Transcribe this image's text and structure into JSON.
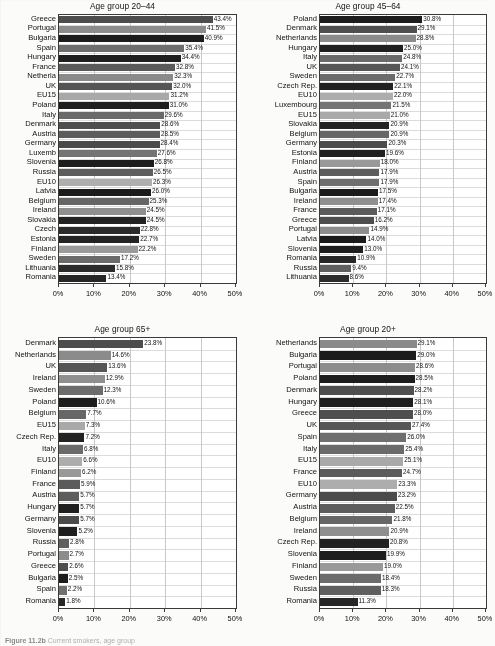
{
  "figure": {
    "caption_prefix": "Figure 11.2b",
    "caption_rest": "Current smokers, age group"
  },
  "axis": {
    "ticks": [
      "0%",
      "10%",
      "20%",
      "30%",
      "40%",
      "50%"
    ],
    "min": 0,
    "max": 50
  },
  "chart_data": [
    {
      "type": "bar",
      "orientation": "horizontal",
      "title": "Age group 20–44",
      "xlabel": "",
      "ylabel": "",
      "xlim": [
        0,
        50
      ],
      "grid": true,
      "legend": "none",
      "categories": [
        "Greece",
        "Portugal",
        "Bulgaria",
        "Spain",
        "Hungary",
        "France",
        "Netherla",
        "UK",
        "EU15",
        "Poland",
        "Italy",
        "Denmark",
        "Austria",
        "Germany",
        "Luxemb",
        "Slovenia",
        "Russia",
        "EU10",
        "Latvia",
        "Belgium",
        "Ireland",
        "Slovakia",
        "Czech",
        "Estonia",
        "Finland",
        "Sweden",
        "Lithuania",
        "Romania"
      ],
      "values": [
        43.4,
        41.5,
        40.9,
        35.4,
        34.4,
        32.8,
        32.3,
        32.0,
        31.2,
        31.0,
        29.6,
        28.6,
        28.5,
        28.4,
        27.6,
        26.8,
        26.5,
        26.3,
        26.0,
        25.3,
        24.5,
        24.5,
        22.8,
        22.7,
        22.2,
        17.2,
        15.8,
        13.4
      ],
      "labels": [
        "43.4%",
        "41.5%",
        "40.9%",
        "35.4%",
        "34.4%",
        "32.8%",
        "32.3%",
        "32.0%",
        "31.2%",
        "31.0%",
        "29.6%",
        "28.6%",
        "28.5%",
        "28.4%",
        "27.6%",
        "26.8%",
        "26.5%",
        "26.3%",
        "26.0%",
        "25.3%",
        "24.5%",
        "24.5%",
        "22.8%",
        "22.7%",
        "22.2%",
        "17.2%",
        "15.8%",
        "13.4%"
      ],
      "shades": [
        "#4d4d4d",
        "#8c8c8c",
        "#1c1c1c",
        "#6e6e6e",
        "#1f1f1f",
        "#5a5a5a",
        "#8a8a8a",
        "#555555",
        "#a8a8a8",
        "#1e1e1e",
        "#6a6a6a",
        "#4f4f4f",
        "#5c5c5c",
        "#4a4a4a",
        "#747474",
        "#1d1d1d",
        "#5e5e5e",
        "#aeaeae",
        "#1b1b1b",
        "#666666",
        "#8f8f8f",
        "#222222",
        "#2a2a2a",
        "#232323",
        "#9a9a9a",
        "#6b6b6b",
        "#2b2b2b",
        "#262626"
      ]
    },
    {
      "type": "bar",
      "orientation": "horizontal",
      "title": "Age group 45–64",
      "xlabel": "",
      "ylabel": "",
      "xlim": [
        0,
        50
      ],
      "grid": true,
      "legend": "none",
      "categories": [
        "Poland",
        "Denmark",
        "Netherlands",
        "Hungary",
        "Italy",
        "UK",
        "Sweden",
        "Czech Rep.",
        "EU10",
        "Luxembourg",
        "EU15",
        "Slovakia",
        "Belgium",
        "Germany",
        "Estonia",
        "Finland",
        "Austria",
        "Spain",
        "Bulgaria",
        "Ireland",
        "France",
        "Greece",
        "Portugal",
        "Latvia",
        "Slovenia",
        "Romania",
        "Russia",
        "Lithuania"
      ],
      "values": [
        30.8,
        29.1,
        28.8,
        25.0,
        24.8,
        24.1,
        22.7,
        22.1,
        22.0,
        21.5,
        21.0,
        20.9,
        20.9,
        20.3,
        19.6,
        18.0,
        17.9,
        17.9,
        17.5,
        17.4,
        17.1,
        16.2,
        14.9,
        14.0,
        13.0,
        10.9,
        9.4,
        8.6
      ],
      "labels": [
        "30.8%",
        "29.1%",
        "28.8%",
        "25.0%",
        "24.8%",
        "24.1%",
        "22.7%",
        "22.1%",
        "22.0%",
        "21.5%",
        "21.0%",
        "20.9%",
        "20.9%",
        "20.3%",
        "19.6%",
        "18.0%",
        "17.9%",
        "17.9%",
        "17.5%",
        "17.4%",
        "17.1%",
        "16.2%",
        "14.9%",
        "14.0%",
        "13.0%",
        "10.9%",
        "9.4%",
        "8.6%"
      ],
      "shades": [
        "#1d1d1d",
        "#4f4f4f",
        "#8b8b8b",
        "#1f1f1f",
        "#6a6a6a",
        "#565656",
        "#6c6c6c",
        "#222222",
        "#adadad",
        "#757575",
        "#a9a9a9",
        "#242424",
        "#676767",
        "#4b4b4b",
        "#202020",
        "#999999",
        "#5d5d5d",
        "#6f6f6f",
        "#1c1c1c",
        "#8f8f8f",
        "#5b5b5b",
        "#4e4e4e",
        "#8d8d8d",
        "#1b1b1b",
        "#1e1e1e",
        "#272727",
        "#5f5f5f",
        "#2c2c2c"
      ]
    },
    {
      "type": "bar",
      "orientation": "horizontal",
      "title": "Age group 65+",
      "xlabel": "",
      "ylabel": "",
      "xlim": [
        0,
        50
      ],
      "grid": true,
      "legend": "none",
      "categories": [
        "Denmark",
        "Netherlands",
        "UK",
        "Ireland",
        "Sweden",
        "Poland",
        "Belgium",
        "EU15",
        "Czech Rep.",
        "Italy",
        "EU10",
        "Finland",
        "France",
        "Austria",
        "Hungary",
        "Germany",
        "Slovenia",
        "Russia",
        "Portugal",
        "Greece",
        "Bulgaria",
        "Spain",
        "Romania"
      ],
      "values": [
        23.8,
        14.6,
        13.6,
        12.9,
        12.3,
        10.6,
        7.7,
        7.3,
        7.2,
        6.8,
        6.6,
        6.2,
        5.9,
        5.7,
        5.7,
        5.7,
        5.2,
        2.8,
        2.7,
        2.6,
        2.5,
        2.2,
        1.8
      ],
      "labels": [
        "23.8%",
        "14.6%",
        "13.6%",
        "12.9%",
        "12.3%",
        "10.6%",
        "7.7%",
        "7.3%",
        "7.2%",
        "6.8%",
        "6.6%",
        "6.2%",
        "5.9%",
        "5.7%",
        "5.7%",
        "5.7%",
        "5.2%",
        "2.8%",
        "2.7%",
        "2.6%",
        "2.5%",
        "2.2%",
        "1.8%"
      ],
      "shades": [
        "#4d4d4d",
        "#8b8b8b",
        "#565656",
        "#8f8f8f",
        "#6c6c6c",
        "#1d1d1d",
        "#676767",
        "#a9a9a9",
        "#222222",
        "#6a6a6a",
        "#adadad",
        "#999999",
        "#5b5b5b",
        "#5d5d5d",
        "#1f1f1f",
        "#4b4b4b",
        "#1e1e1e",
        "#5f5f5f",
        "#8d8d8d",
        "#4e4e4e",
        "#1c1c1c",
        "#6f6f6f",
        "#272727"
      ]
    },
    {
      "type": "bar",
      "orientation": "horizontal",
      "title": "Age group 20+",
      "xlabel": "",
      "ylabel": "",
      "xlim": [
        0,
        50
      ],
      "grid": true,
      "legend": "none",
      "categories": [
        "Netherlands",
        "Bulgaria",
        "Portugal",
        "Poland",
        "Denmark",
        "Hungary",
        "Greece",
        "UK",
        "Spain",
        "Italy",
        "EU15",
        "France",
        "EU10",
        "Germany",
        "Austria",
        "Belgium",
        "Ireland",
        "Czech Rep.",
        "Slovenia",
        "Finland",
        "Sweden",
        "Russia",
        "Romania"
      ],
      "values": [
        29.1,
        29.0,
        28.6,
        28.5,
        28.2,
        28.1,
        28.0,
        27.4,
        26.0,
        25.4,
        25.1,
        24.7,
        23.3,
        23.2,
        22.5,
        21.8,
        20.9,
        20.8,
        19.9,
        19.0,
        18.4,
        18.3,
        11.3
      ],
      "labels": [
        "29.1%",
        "29.0%",
        "28.6%",
        "28.5%",
        "28.2%",
        "28.1%",
        "28.0%",
        "27.4%",
        "26.0%",
        "25.4%",
        "25.1%",
        "24.7%",
        "23.3%",
        "23.2%",
        "22.5%",
        "21.8%",
        "20.9%",
        "20.8%",
        "19.9%",
        "19.0%",
        "18.4%",
        "18.3%",
        "11.3%"
      ],
      "shades": [
        "#8b8b8b",
        "#1c1c1c",
        "#8d8d8d",
        "#1d1d1d",
        "#4f4f4f",
        "#1f1f1f",
        "#4e4e4e",
        "#565656",
        "#6f6f6f",
        "#6a6a6a",
        "#a9a9a9",
        "#5b5b5b",
        "#adadad",
        "#4b4b4b",
        "#5d5d5d",
        "#676767",
        "#8f8f8f",
        "#222222",
        "#1e1e1e",
        "#999999",
        "#6c6c6c",
        "#5f5f5f",
        "#272727"
      ]
    }
  ]
}
